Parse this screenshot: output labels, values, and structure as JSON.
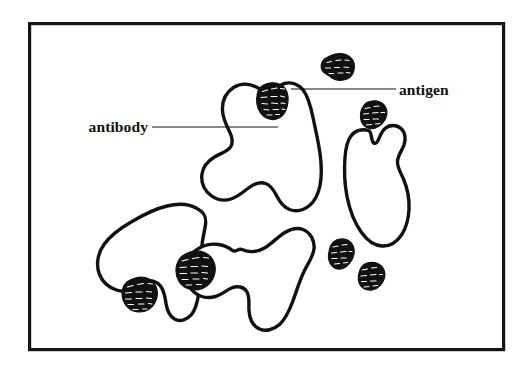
{
  "figure": {
    "background_color": "#ffffff",
    "ink_color": "#111111",
    "frame": {
      "name": "figure-border",
      "x": 28,
      "y": 22,
      "width": 477,
      "height": 329,
      "stroke_width": 3.2
    },
    "labels": [
      {
        "id": "antibody",
        "text": "antibody",
        "text_anchor_x": 148,
        "text_anchor_y": 132,
        "leader": {
          "x1": 152,
          "y1": 127,
          "x2": 278,
          "y2": 127
        }
      },
      {
        "id": "antigen",
        "text": "antigen",
        "text_anchor_x": 399,
        "text_anchor_y": 95,
        "leader": {
          "x1": 291,
          "y1": 89,
          "x2": 396,
          "y2": 89
        }
      }
    ],
    "antibodies": [
      {
        "id": "antibody-upper-center",
        "bound_antigens": 1
      },
      {
        "id": "antibody-right",
        "bound_antigens": 0
      },
      {
        "id": "antibody-lower-left",
        "bound_antigens": 1
      },
      {
        "id": "antibody-lower-center",
        "bound_antigens": 1
      }
    ],
    "antigens": [
      {
        "id": "antigen-bound-top",
        "state": "bound",
        "cx": 274,
        "cy": 96
      },
      {
        "id": "antigen-free-top-right",
        "state": "free",
        "cx": 341,
        "cy": 65
      },
      {
        "id": "antigen-free-right-upper",
        "state": "free",
        "cx": 374,
        "cy": 114
      },
      {
        "id": "antigen-free-right-lower",
        "state": "free",
        "cx": 342,
        "cy": 252
      },
      {
        "id": "antigen-free-bottom-right",
        "state": "free",
        "cx": 372,
        "cy": 275
      },
      {
        "id": "antigen-bound-lower-center",
        "state": "bound",
        "cx": 194,
        "cy": 268
      },
      {
        "id": "antigen-bound-lower-left",
        "state": "bound",
        "cx": 140,
        "cy": 293
      }
    ],
    "counts": {
      "antibody_count": 4,
      "antigen_count": 7,
      "bound_antigen_count": 3,
      "free_antigen_count": 4
    }
  }
}
